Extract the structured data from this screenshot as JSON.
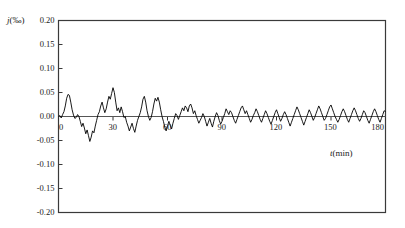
{
  "figure": {
    "background_color": "#ffffff",
    "line_color": "#000000",
    "frame_color": "#3a3a3a",
    "zero_line_color": "#555555"
  },
  "axes": {
    "y_axis_title_symbol": "j",
    "y_axis_title_unit": "(‰)",
    "x_axis_title_symbol": "t",
    "x_axis_title_unit": "(min)",
    "y_tick_labels": [
      "0.20",
      "0.15",
      "0.10",
      "0.05",
      "0.00",
      "-0.05",
      "-0.10",
      "-0.15",
      "-0.20"
    ],
    "x_tick_labels": [
      "0",
      "30",
      "60",
      "90",
      "120",
      "150",
      "180"
    ]
  },
  "chart_data": {
    "type": "line",
    "title": "",
    "subtitle": "",
    "xlabel": "t (min)",
    "ylabel": "j (‰)",
    "xlim": [
      0,
      180
    ],
    "ylim": [
      -0.2,
      0.2
    ],
    "xticks": [
      0,
      30,
      60,
      90,
      120,
      150,
      180
    ],
    "yticks": [
      -0.2,
      -0.15,
      -0.1,
      -0.05,
      0.0,
      0.05,
      0.1,
      0.15,
      0.2
    ],
    "grid": false,
    "legend": "none",
    "annotations": [
      {
        "text": "zero reference line drawn at j = 0.00"
      }
    ],
    "series": [
      {
        "name": "j",
        "x": [
          0,
          0.75,
          1.5,
          2.25,
          3,
          3.75,
          4.5,
          5.25,
          6,
          6.75,
          7.5,
          8.25,
          9,
          9.75,
          10.5,
          11.25,
          12,
          12.75,
          13.5,
          14.25,
          15,
          15.75,
          16.5,
          17.25,
          18,
          18.75,
          19.5,
          20.25,
          21,
          21.75,
          22.5,
          23.25,
          24,
          24.75,
          25.5,
          26.25,
          27,
          27.75,
          28.5,
          29.25,
          30,
          30.75,
          31.5,
          32.25,
          33,
          33.75,
          34.5,
          35.25,
          36,
          36.75,
          37.5,
          38.25,
          39,
          39.75,
          40.5,
          41.25,
          42,
          42.75,
          43.5,
          44.25,
          45,
          45.75,
          46.5,
          47.25,
          48,
          48.75,
          49.5,
          50.25,
          51,
          51.75,
          52.5,
          53.25,
          54,
          54.75,
          55.5,
          56.25,
          57,
          57.75,
          58.5,
          59.25,
          60,
          60.75,
          61.5,
          62.25,
          63,
          63.75,
          64.5,
          65.25,
          66,
          66.75,
          67.5,
          68.25,
          69,
          69.75,
          70.5,
          71.25,
          72,
          72.75,
          73.5,
          74.25,
          75,
          75.75,
          76.5,
          77.25,
          78,
          78.75,
          79.5,
          80.25,
          81,
          81.75,
          82.5,
          83.25,
          84,
          84.75,
          85.5,
          86.25,
          87,
          87.75,
          88.5,
          89.25,
          90,
          90.75,
          91.5,
          92.25,
          93,
          93.75,
          94.5,
          95.25,
          96,
          96.75,
          97.5,
          98.25,
          99,
          99.75,
          100.5,
          101.25,
          102,
          102.75,
          103.5,
          104.25,
          105,
          105.75,
          106.5,
          107.25,
          108,
          108.75,
          109.5,
          110.25,
          111,
          111.75,
          112.5,
          113.25,
          114,
          114.75,
          115.5,
          116.25,
          117,
          117.75,
          118.5,
          119.25,
          120,
          120.75,
          121.5,
          122.25,
          123,
          123.75,
          124.5,
          125.25,
          126,
          126.75,
          127.5,
          128.25,
          129,
          129.75,
          130.5,
          131.25,
          132,
          132.75,
          133.5,
          134.25,
          135,
          135.75,
          136.5,
          137.25,
          138,
          138.75,
          139.5,
          140.25,
          141,
          141.75,
          142.5,
          143.25,
          144,
          144.75,
          145.5,
          146.25,
          147,
          147.75,
          148.5,
          149.25,
          150,
          150.75,
          151.5,
          152.25,
          153,
          153.75,
          154.5,
          155.25,
          156,
          156.75,
          157.5,
          158.25,
          159,
          159.75,
          160.5,
          161.25,
          162,
          162.75,
          163.5,
          164.25,
          165,
          165.75,
          166.5,
          167.25,
          168,
          168.75,
          169.5,
          170.25,
          171,
          171.75,
          172.5,
          173.25,
          174,
          174.75,
          175.5,
          176.25,
          177,
          177.75,
          178.5,
          179.25,
          180
        ],
        "y": [
          0.0,
          0.002,
          -0.003,
          0.004,
          0.01,
          0.022,
          0.038,
          0.046,
          0.044,
          0.03,
          0.014,
          0.003,
          -0.004,
          -0.002,
          0.004,
          0.0,
          -0.01,
          -0.021,
          -0.014,
          -0.024,
          -0.036,
          -0.028,
          -0.04,
          -0.052,
          -0.043,
          -0.03,
          -0.034,
          -0.02,
          -0.008,
          0.004,
          0.01,
          0.022,
          0.03,
          0.018,
          0.008,
          0.016,
          0.03,
          0.042,
          0.036,
          0.048,
          0.06,
          0.05,
          0.03,
          0.012,
          0.018,
          0.008,
          0.02,
          0.01,
          -0.002,
          0.0,
          -0.012,
          -0.02,
          -0.03,
          -0.022,
          -0.014,
          -0.025,
          -0.033,
          -0.02,
          -0.008,
          0.0,
          0.008,
          0.02,
          0.036,
          0.042,
          0.03,
          0.012,
          0.0,
          -0.008,
          -0.002,
          0.01,
          0.026,
          0.038,
          0.032,
          0.04,
          0.03,
          0.014,
          0.0,
          -0.01,
          -0.022,
          -0.03,
          -0.02,
          -0.01,
          -0.018,
          -0.026,
          -0.014,
          -0.004,
          0.006,
          0.002,
          -0.006,
          0.002,
          0.01,
          0.018,
          0.012,
          0.022,
          0.018,
          0.01,
          0.022,
          0.026,
          0.018,
          0.006,
          0.012,
          0.002,
          -0.006,
          -0.014,
          -0.008,
          -0.002,
          0.006,
          0.0,
          -0.01,
          -0.02,
          -0.012,
          -0.004,
          -0.014,
          -0.022,
          -0.01,
          0.0,
          0.008,
          0.002,
          -0.008,
          -0.016,
          -0.01,
          -0.002,
          0.006,
          0.016,
          0.01,
          0.004,
          0.012,
          0.008,
          0.0,
          -0.008,
          -0.014,
          -0.006,
          0.002,
          0.01,
          0.018,
          0.022,
          0.014,
          0.006,
          0.012,
          0.004,
          -0.004,
          -0.012,
          -0.006,
          0.002,
          0.008,
          0.016,
          0.01,
          0.002,
          -0.006,
          -0.012,
          -0.004,
          0.004,
          0.012,
          0.006,
          -0.002,
          -0.01,
          -0.016,
          -0.008,
          0.0,
          0.008,
          0.014,
          0.006,
          -0.002,
          -0.01,
          -0.004,
          0.004,
          0.01,
          0.004,
          -0.004,
          -0.012,
          -0.02,
          -0.012,
          -0.004,
          0.004,
          0.012,
          0.02,
          0.014,
          0.006,
          -0.002,
          -0.01,
          -0.018,
          -0.01,
          -0.002,
          0.006,
          0.014,
          0.008,
          0.0,
          -0.008,
          -0.002,
          0.006,
          0.014,
          0.022,
          0.016,
          0.008,
          0.0,
          -0.008,
          -0.004,
          0.004,
          0.012,
          0.02,
          0.024,
          0.016,
          0.008,
          0.0,
          -0.006,
          -0.012,
          -0.006,
          0.002,
          0.01,
          0.016,
          0.01,
          0.002,
          -0.006,
          -0.012,
          -0.004,
          0.004,
          0.012,
          0.018,
          0.012,
          0.004,
          -0.004,
          -0.01,
          -0.004,
          0.004,
          0.012,
          0.008,
          0.0,
          -0.008,
          -0.014,
          -0.006,
          0.002,
          0.01,
          0.016,
          0.01,
          0.002,
          -0.006,
          -0.012,
          -0.004,
          0.004,
          0.012,
          0.01
        ]
      }
    ]
  }
}
